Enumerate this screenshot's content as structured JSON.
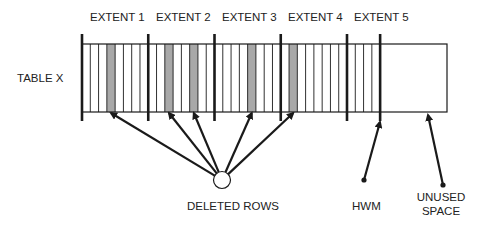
{
  "diagram": {
    "table_label": "TABLE X",
    "extents": [
      {
        "label": "EXTENT 1",
        "blocks": 8,
        "deleted_blocks": [
          4
        ]
      },
      {
        "label": "EXTENT 2",
        "blocks": 8,
        "deleted_blocks": [
          3,
          6
        ]
      },
      {
        "label": "EXTENT 3",
        "blocks": 8,
        "deleted_blocks": [
          5
        ]
      },
      {
        "label": "EXTENT 4",
        "blocks": 8,
        "deleted_blocks": [
          2
        ]
      },
      {
        "label": "EXTENT 5",
        "blocks": 8,
        "used_blocks": 4,
        "deleted_blocks": []
      }
    ],
    "annotations": {
      "deleted_rows": "DELETED ROWS",
      "hwm": "HWM",
      "unused_space_line1": "UNUSED",
      "unused_space_line2": "SPACE"
    },
    "colors": {
      "line": "#1a1a1a",
      "deleted_fill": "#a8a8a8",
      "text": "#222222"
    }
  }
}
